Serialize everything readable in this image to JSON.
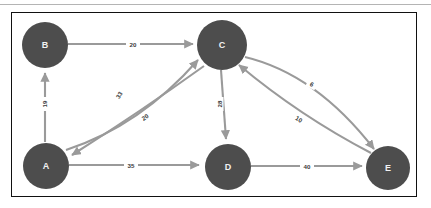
{
  "diagram": {
    "background_color": "#ffffff",
    "border_color": "#111111",
    "node_color": "#4d4d4d",
    "node_label_color": "#f2f2f2",
    "edge_color": "#9a9a9a",
    "edge_label_color": "#3a3a3a",
    "nodes": [
      {
        "id": "B",
        "label": "B",
        "cx": 45,
        "cy": 45,
        "r": 23
      },
      {
        "id": "C",
        "label": "C",
        "cx": 222,
        "cy": 45,
        "r": 25
      },
      {
        "id": "A",
        "label": "A",
        "cx": 46,
        "cy": 166,
        "r": 23
      },
      {
        "id": "D",
        "label": "D",
        "cx": 228,
        "cy": 167,
        "r": 23
      },
      {
        "id": "E",
        "label": "E",
        "cx": 388,
        "cy": 168,
        "r": 22
      }
    ],
    "edges": [
      {
        "from": "A",
        "to": "B",
        "weight": "19",
        "label_x": 44,
        "label_y": 104,
        "label_rotate": -90
      },
      {
        "from": "B",
        "to": "C",
        "weight": "20",
        "label_x": 133,
        "label_y": 44,
        "label_rotate": 0
      },
      {
        "from": "A",
        "to": "C",
        "weight": "33",
        "label_x": 119,
        "label_y": 95,
        "label_rotate": -57
      },
      {
        "from": "C",
        "to": "A",
        "weight": "20",
        "label_x": 145,
        "label_y": 117,
        "label_rotate": -33
      },
      {
        "from": "C",
        "to": "D",
        "weight": "28",
        "label_x": 219,
        "label_y": 104,
        "label_rotate": -90
      },
      {
        "from": "C",
        "to": "E",
        "weight": "6",
        "label_x": 312,
        "label_y": 84,
        "label_rotate": 28
      },
      {
        "from": "E",
        "to": "C",
        "weight": "10",
        "label_x": 299,
        "label_y": 119,
        "label_rotate": 31
      },
      {
        "from": "A",
        "to": "D",
        "weight": "35",
        "label_x": 131,
        "label_y": 165,
        "label_rotate": 0
      },
      {
        "from": "D",
        "to": "E",
        "weight": "40",
        "label_x": 307,
        "label_y": 166,
        "label_rotate": 0
      }
    ]
  }
}
